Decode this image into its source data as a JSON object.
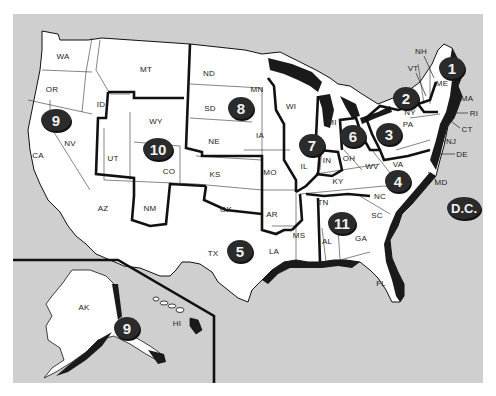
{
  "map": {
    "title": "U.S. Regions Map",
    "colors": {
      "background": "#ffffff",
      "water": "#cfcfcf",
      "land": "#ffffff",
      "region_border": "#111111",
      "badge_fill": "#2b2b2b",
      "badge_text": "#f2f2f2"
    },
    "state_labels": [
      {
        "code": "WA",
        "x": 63,
        "y": 56
      },
      {
        "code": "OR",
        "x": 52,
        "y": 89
      },
      {
        "code": "CA",
        "x": 38,
        "y": 155
      },
      {
        "code": "NV",
        "x": 70,
        "y": 143
      },
      {
        "code": "ID",
        "x": 101,
        "y": 104
      },
      {
        "code": "MT",
        "x": 146,
        "y": 69
      },
      {
        "code": "WY",
        "x": 156,
        "y": 121
      },
      {
        "code": "UT",
        "x": 113,
        "y": 158
      },
      {
        "code": "CO",
        "x": 169,
        "y": 171
      },
      {
        "code": "AZ",
        "x": 103,
        "y": 208
      },
      {
        "code": "NM",
        "x": 150,
        "y": 208
      },
      {
        "code": "ND",
        "x": 209,
        "y": 73
      },
      {
        "code": "SD",
        "x": 210,
        "y": 108
      },
      {
        "code": "NE",
        "x": 214,
        "y": 141
      },
      {
        "code": "KS",
        "x": 215,
        "y": 174
      },
      {
        "code": "OK",
        "x": 226,
        "y": 209
      },
      {
        "code": "TX",
        "x": 213,
        "y": 253
      },
      {
        "code": "MN",
        "x": 257,
        "y": 89
      },
      {
        "code": "IA",
        "x": 260,
        "y": 135
      },
      {
        "code": "MO",
        "x": 270,
        "y": 172
      },
      {
        "code": "AR",
        "x": 272,
        "y": 214
      },
      {
        "code": "LA",
        "x": 274,
        "y": 251
      },
      {
        "code": "WI",
        "x": 291,
        "y": 106
      },
      {
        "code": "IL",
        "x": 304,
        "y": 166
      },
      {
        "code": "IN",
        "x": 327,
        "y": 160
      },
      {
        "code": "MI",
        "x": 332,
        "y": 122
      },
      {
        "code": "OH",
        "x": 349,
        "y": 158
      },
      {
        "code": "KY",
        "x": 338,
        "y": 181
      },
      {
        "code": "TN",
        "x": 323,
        "y": 202
      },
      {
        "code": "MS",
        "x": 299,
        "y": 235
      },
      {
        "code": "AL",
        "x": 327,
        "y": 241
      },
      {
        "code": "GA",
        "x": 361,
        "y": 238
      },
      {
        "code": "FL",
        "x": 381,
        "y": 283
      },
      {
        "code": "SC",
        "x": 377,
        "y": 215
      },
      {
        "code": "NC",
        "x": 380,
        "y": 196
      },
      {
        "code": "VA",
        "x": 398,
        "y": 164
      },
      {
        "code": "WV",
        "x": 372,
        "y": 166
      },
      {
        "code": "MD",
        "x": 441,
        "y": 182
      },
      {
        "code": "DE",
        "x": 462,
        "y": 154
      },
      {
        "code": "NJ",
        "x": 451,
        "y": 141
      },
      {
        "code": "PA",
        "x": 408,
        "y": 124
      },
      {
        "code": "NY",
        "x": 410,
        "y": 112
      },
      {
        "code": "CT",
        "x": 467,
        "y": 129
      },
      {
        "code": "RI",
        "x": 474,
        "y": 113
      },
      {
        "code": "MA",
        "x": 467,
        "y": 98
      },
      {
        "code": "ME",
        "x": 442,
        "y": 83
      },
      {
        "code": "NH",
        "x": 421,
        "y": 51
      },
      {
        "code": "VT",
        "x": 413,
        "y": 68
      },
      {
        "code": "AK",
        "x": 84,
        "y": 307
      },
      {
        "code": "HI",
        "x": 177,
        "y": 323
      }
    ],
    "region_badges": [
      {
        "label": "1",
        "x": 452,
        "y": 68,
        "w": 26,
        "h": 22
      },
      {
        "label": "2",
        "x": 406,
        "y": 98,
        "w": 26,
        "h": 22
      },
      {
        "label": "3",
        "x": 389,
        "y": 134,
        "w": 26,
        "h": 22
      },
      {
        "label": "4",
        "x": 398,
        "y": 181,
        "w": 26,
        "h": 22
      },
      {
        "label": "5",
        "x": 240,
        "y": 251,
        "w": 26,
        "h": 22
      },
      {
        "label": "6",
        "x": 353,
        "y": 136,
        "w": 26,
        "h": 22
      },
      {
        "label": "7",
        "x": 312,
        "y": 145,
        "w": 26,
        "h": 22
      },
      {
        "label": "8",
        "x": 241,
        "y": 108,
        "w": 26,
        "h": 22
      },
      {
        "label": "9",
        "x": 56,
        "y": 120,
        "w": 30,
        "h": 22
      },
      {
        "label": "10",
        "x": 158,
        "y": 149,
        "w": 30,
        "h": 22
      },
      {
        "label": "11",
        "x": 342,
        "y": 223,
        "w": 28,
        "h": 22
      },
      {
        "label": "9",
        "x": 127,
        "y": 328,
        "w": 26,
        "h": 22
      },
      {
        "label": "D.C.",
        "x": 464,
        "y": 208,
        "w": 34,
        "h": 22
      }
    ]
  }
}
